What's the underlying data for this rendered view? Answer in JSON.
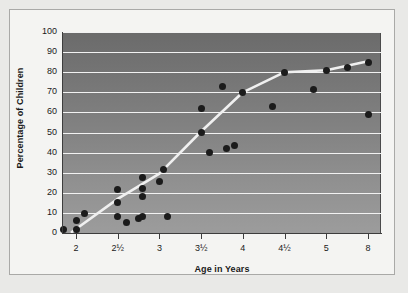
{
  "chart_data": {
    "type": "scatter",
    "title": "",
    "xlabel": "Age in Years",
    "ylabel": "Percentage of Children",
    "xticklabels": [
      "2",
      "2½",
      "3",
      "3½",
      "4",
      "4½",
      "5",
      "8"
    ],
    "xtick_positions": [
      0,
      1,
      2,
      3,
      4,
      5,
      6,
      7
    ],
    "x_axis_note": "categorical/non-linear axis: evenly spaced ticks for ages 2, 2.5, 3, 3.5, 4, 4.5, 5, 8",
    "yticklabels": [
      "0",
      "10",
      "20",
      "30",
      "40",
      "50",
      "60",
      "70",
      "80",
      "90",
      "100"
    ],
    "ylim": [
      0,
      100
    ],
    "ytick_step": 10,
    "grid": "horizontal white gridlines at every 10 units",
    "legend": "none",
    "marker_color": "#1b1b1b",
    "trend_line_color": "#f0f0f0",
    "plot_background": "vertical gray gradient, dark at top to light at bottom",
    "points": [
      {
        "age": 1.85,
        "pct": 1.5
      },
      {
        "age": 2.0,
        "pct": 1.5
      },
      {
        "age": 2.0,
        "pct": 6.0
      },
      {
        "age": 2.1,
        "pct": 9.5
      },
      {
        "age": 2.5,
        "pct": 8.0
      },
      {
        "age": 2.5,
        "pct": 15.0
      },
      {
        "age": 2.5,
        "pct": 21.5
      },
      {
        "age": 2.6,
        "pct": 5.0
      },
      {
        "age": 2.75,
        "pct": 7.0
      },
      {
        "age": 2.8,
        "pct": 8.0
      },
      {
        "age": 2.8,
        "pct": 18.0
      },
      {
        "age": 2.8,
        "pct": 22.0
      },
      {
        "age": 2.8,
        "pct": 27.5
      },
      {
        "age": 3.0,
        "pct": 25.5
      },
      {
        "age": 3.05,
        "pct": 31.5
      },
      {
        "age": 3.1,
        "pct": 8.0
      },
      {
        "age": 3.5,
        "pct": 50.0
      },
      {
        "age": 3.5,
        "pct": 62.0
      },
      {
        "age": 3.6,
        "pct": 40.0
      },
      {
        "age": 3.75,
        "pct": 73.0
      },
      {
        "age": 3.8,
        "pct": 42.0
      },
      {
        "age": 3.9,
        "pct": 43.5
      },
      {
        "age": 4.0,
        "pct": 70.0
      },
      {
        "age": 4.35,
        "pct": 63.0
      },
      {
        "age": 4.5,
        "pct": 80.0
      },
      {
        "age": 4.85,
        "pct": 71.5
      },
      {
        "age": 5.0,
        "pct": 81.0
      },
      {
        "age": 6.5,
        "pct": 82.5
      },
      {
        "age": 8.0,
        "pct": 59.0
      },
      {
        "age": 8.0,
        "pct": 85.0
      }
    ],
    "trend_line": [
      {
        "age": 1.95,
        "pct": 0.5
      },
      {
        "age": 2.5,
        "pct": 17.0
      },
      {
        "age": 3.0,
        "pct": 29.5
      },
      {
        "age": 3.5,
        "pct": 50.5
      },
      {
        "age": 4.0,
        "pct": 70.0
      },
      {
        "age": 4.5,
        "pct": 80.0
      },
      {
        "age": 5.0,
        "pct": 81.0
      },
      {
        "age": 8.0,
        "pct": 85.5
      }
    ]
  }
}
